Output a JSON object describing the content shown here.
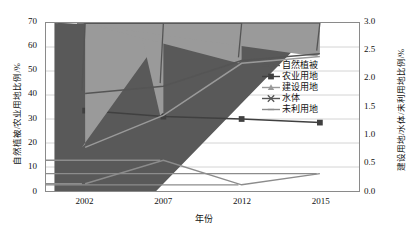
{
  "chart_data": {
    "type": "line",
    "title": "",
    "xlabel": "年份",
    "ylabel": "自然植被/农业用地比例/%",
    "ylabel_right": "建设用地/水体/未利用地比例/%",
    "categories": [
      "2002",
      "2007",
      "2012",
      "2015"
    ],
    "x": [
      2002,
      2007,
      2012,
      2015
    ],
    "ylim": [
      0,
      70
    ],
    "yticks": [
      "0",
      "10",
      "20",
      "30",
      "40",
      "50",
      "60",
      "70"
    ],
    "ylim_right": [
      0,
      3
    ],
    "yticks_right": [
      "0.0",
      "0.5",
      "1.0",
      "1.5",
      "2.0",
      "2.5",
      "3.0"
    ],
    "grid": true,
    "legend_position": "center-right",
    "series": [
      {
        "name": "自然植被",
        "axis": "left",
        "marker": "diamond",
        "color": "#595959",
        "values": [
          64.0,
          64.7,
          65.2,
          66.5
        ]
      },
      {
        "name": "农业用地",
        "axis": "left",
        "marker": "square",
        "color": "#404040",
        "values": [
          33.5,
          31.0,
          30.0,
          28.5
        ]
      },
      {
        "name": "建设用地",
        "axis": "right",
        "marker": "triangle",
        "color": "#9a9a9a",
        "values": [
          0.78,
          1.35,
          2.28,
          2.4
        ]
      },
      {
        "name": "水体",
        "axis": "right",
        "marker": "cross",
        "color": "#555555",
        "values": [
          1.74,
          1.87,
          2.33,
          2.45
        ]
      },
      {
        "name": "未利用地",
        "axis": "right",
        "marker": "dash",
        "color": "#8c8c8c",
        "values": [
          0.13,
          0.55,
          0.11,
          0.31
        ]
      }
    ]
  },
  "axes": {
    "left_title": "自然植被/农业用地比例/%",
    "right_title": "建设用地/水体/未利用地比例/%",
    "x_title": "年份"
  },
  "legend": {
    "items": [
      {
        "label": "自然植被"
      },
      {
        "label": "农业用地"
      },
      {
        "label": "建设用地"
      },
      {
        "label": "水体"
      },
      {
        "label": "未利用地"
      }
    ]
  }
}
